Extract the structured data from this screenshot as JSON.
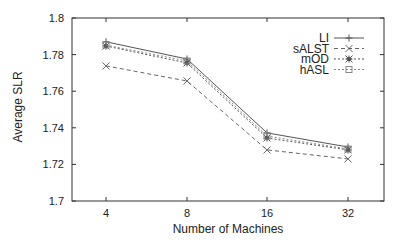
{
  "chart_data": {
    "type": "line",
    "title": "",
    "xlabel": "Number of Machines",
    "ylabel": "Average SLR",
    "categories": [
      "4",
      "8",
      "16",
      "32"
    ],
    "ylim": [
      1.7,
      1.8
    ],
    "yticks": [
      "1.7",
      "1.72",
      "1.74",
      "1.76",
      "1.78",
      "1.8"
    ],
    "grid": false,
    "legend_position": "top-right inside",
    "series": [
      {
        "name": "LI",
        "marker": "plus",
        "line_style": "solid",
        "color": "#555555",
        "values": [
          1.787,
          1.7776,
          1.7372,
          1.7295
        ]
      },
      {
        "name": "sALST",
        "marker": "cross",
        "line_style": "dashed",
        "color": "#666666",
        "values": [
          1.7738,
          1.7656,
          1.7279,
          1.723
        ]
      },
      {
        "name": "mOD",
        "marker": "star",
        "line_style": "dotted",
        "color": "#555555",
        "values": [
          1.7847,
          1.7754,
          1.7344,
          1.7279
        ]
      },
      {
        "name": "hASL",
        "marker": "square",
        "line_style": "dotted",
        "color": "#888888",
        "values": [
          1.7852,
          1.7765,
          1.7355,
          1.7284
        ]
      }
    ]
  }
}
